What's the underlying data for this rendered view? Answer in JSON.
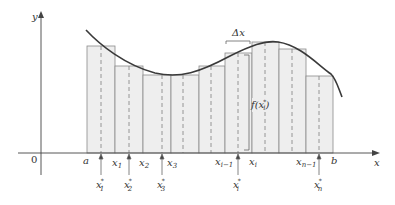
{
  "diagram": {
    "colors": {
      "rect_fill": "#eeeeee",
      "rect_stroke": "#8a8a8a",
      "curve": "#3a3a3a",
      "axis": "#444444",
      "dashed": "#8a8a8a",
      "text": "#333333"
    },
    "axes": {
      "y_label": "y",
      "x_label": "x",
      "origin_label": "0"
    },
    "rectangles": [
      {
        "x0": 87,
        "x1": 115,
        "top": 46,
        "sample_x": 101
      },
      {
        "x0": 115,
        "x1": 143,
        "top": 66,
        "sample_x": 129
      },
      {
        "x0": 143,
        "x1": 171,
        "top": 75,
        "sample_x": 162
      },
      {
        "x0": 171,
        "x1": 199,
        "top": 75,
        "sample_x": 183
      },
      {
        "x0": 199,
        "x1": 225,
        "top": 66,
        "sample_x": 211
      },
      {
        "x0": 225,
        "x1": 252,
        "top": 53,
        "sample_x": 238
      },
      {
        "x0": 252,
        "x1": 279,
        "top": 42,
        "sample_x": 265
      },
      {
        "x0": 279,
        "x1": 306,
        "top": 49,
        "sample_x": 292
      },
      {
        "x0": 306,
        "x1": 333,
        "top": 76,
        "sample_x": 319
      }
    ],
    "partition_labels": {
      "a": "a",
      "x1": "x",
      "x1_sub": "1",
      "x2": "x",
      "x2_sub": "2",
      "x3": "x",
      "x3_sub": "3",
      "xi_minus_1": "x",
      "xi_minus_1_sub": "i−1",
      "xi": "x",
      "xi_sub": "i",
      "xn_minus_1": "x",
      "xn_minus_1_sub": "n−1",
      "b": "b"
    },
    "sample_labels": {
      "s1": "x",
      "s1_sub": "1",
      "s1_sup": "*",
      "s2": "x",
      "s2_sub": "2",
      "s2_sup": "*",
      "s3": "x",
      "s3_sub": "3",
      "s3_sup": "*",
      "si": "x",
      "si_sub": "i",
      "si_sup": "*",
      "sn": "x",
      "sn_sub": "n",
      "sn_sup": "*"
    },
    "annotations": {
      "delta_x": "Δx",
      "f_of_xi_star_prefix": "f(x",
      "f_of_xi_star_sub": "i",
      "f_of_xi_star_sup": "*",
      "f_of_xi_star_suffix": ")"
    }
  }
}
